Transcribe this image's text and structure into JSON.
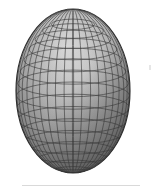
{
  "figure": {
    "title": "Wireframe shaded ellipsoid",
    "background_color": "#ffffff",
    "width": 162,
    "height": 191
  },
  "chart_data": {
    "type": "scatter",
    "title": "Wireframe shaded ellipsoid",
    "subtitle": "",
    "xlabel": "",
    "ylabel": "",
    "grid": true,
    "legend_position": "none",
    "annotations": [],
    "tick_labels": [],
    "surface": {
      "shape": "ellipsoid",
      "center_x": 73,
      "center_y": 91,
      "semi_axis_x": 57,
      "semi_axis_y": 82,
      "meridian_count": 20,
      "parallel_count": 18,
      "wire_color": "#3a3a3a",
      "wire_width": 0.7,
      "rim_color": "#2e2e2e",
      "highlight_x": 78,
      "highlight_y": 46,
      "highlight_color": "#ececec",
      "midtone_color": "#a8a8a8",
      "shadow_color": "#4a4a4a",
      "terminator_color": "#5a5a5a"
    },
    "series": [
      {
        "name": "meridians",
        "values": [
          0,
          18,
          36,
          54,
          72,
          90,
          108,
          126,
          144,
          162,
          180,
          198,
          216,
          234,
          252,
          270,
          288,
          306,
          324,
          342
        ]
      },
      {
        "name": "parallels",
        "values": [
          -80,
          -70,
          -60,
          -50,
          -40,
          -30,
          -20,
          -10,
          0,
          10,
          20,
          30,
          40,
          50,
          60,
          70,
          80
        ]
      }
    ],
    "xlim": [
      16,
      130
    ],
    "ylim": [
      9,
      173
    ]
  },
  "rule": {
    "label": "bottom-divider",
    "color": "#d9d9d9",
    "left": 22,
    "top": 185,
    "width": 118,
    "height": 1
  },
  "speck": {
    "label": "scan-artifact",
    "color": "#e2e2e2",
    "left": 149,
    "top": 65,
    "width": 2,
    "height": 5
  }
}
